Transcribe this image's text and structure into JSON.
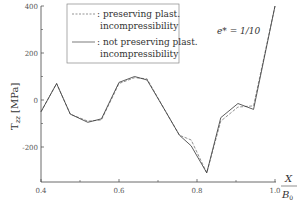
{
  "chart_data": {
    "type": "line",
    "title": "",
    "annotation": "e* = 1/10",
    "xlabel": "X / B0",
    "ylabel": "T_zz [MPa]",
    "xlim": [
      0.4,
      1.0
    ],
    "ylim": [
      -350,
      400
    ],
    "x_ticks": [
      "0.4",
      "0.6",
      "0.8",
      "1.0"
    ],
    "y_ticks": [
      "-200",
      "0",
      "200",
      "400"
    ],
    "grid": false,
    "legend_position": "upper-left-center",
    "series": [
      {
        "name": ": preserving plast. incompressibility",
        "style": "dashed",
        "x": [
          0.4,
          0.44,
          0.475,
          0.52,
          0.555,
          0.6,
          0.64,
          0.672,
          0.72,
          0.755,
          0.785,
          0.825,
          0.861,
          0.905,
          0.945,
          1.0
        ],
        "y": [
          -50,
          70,
          -60,
          -90,
          -85,
          70,
          95,
          90,
          -50,
          -150,
          -170,
          -310,
          -90,
          -30,
          -25,
          400
        ]
      },
      {
        "name": ": not preserving plast. incompressibility",
        "style": "solid",
        "x": [
          0.4,
          0.44,
          0.475,
          0.52,
          0.555,
          0.6,
          0.64,
          0.672,
          0.72,
          0.755,
          0.785,
          0.825,
          0.861,
          0.905,
          0.945,
          1.0
        ],
        "y": [
          -50,
          70,
          -60,
          -95,
          -80,
          75,
          100,
          85,
          -50,
          -150,
          -195,
          -310,
          -75,
          -15,
          -40,
          400
        ]
      }
    ]
  },
  "legend": {
    "line1a": ": preserving plast.",
    "line1b": "incompressibility",
    "line2a": ": not preserving plast.",
    "line2b": "incompressibility"
  },
  "labels": {
    "annotation": "e* = 1/10",
    "ylabel": "T",
    "ylabel_sub": "zz",
    "ylabel_unit": "[MPa]",
    "xlabel_num": "X",
    "xlabel_den": "B",
    "xlabel_den_sub": "0"
  }
}
